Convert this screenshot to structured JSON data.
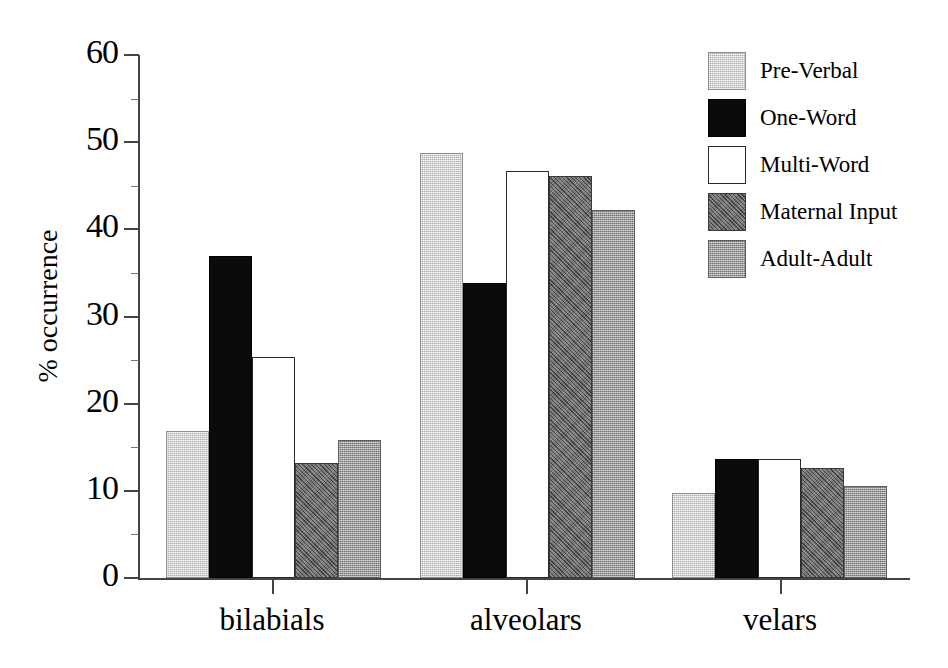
{
  "chart_data": {
    "type": "bar",
    "title": "",
    "xlabel": "",
    "ylabel": "% occurrence",
    "ylim": [
      0,
      60
    ],
    "ytick_step": 10,
    "yticks": [
      "0",
      "10",
      "20",
      "30",
      "40",
      "50",
      "60"
    ],
    "grid": false,
    "legend_position": "top-right",
    "categories": [
      "bilabials",
      "alveolars",
      "velars"
    ],
    "series": [
      {
        "name": "Pre-Verbal",
        "color": "#cdcdcd",
        "values": [
          16.9,
          48.7,
          9.7
        ]
      },
      {
        "name": "One-Word",
        "color": "#0b0b0b",
        "values": [
          36.9,
          33.8,
          13.6
        ]
      },
      {
        "name": "Multi-Word",
        "color": "#ffffff",
        "values": [
          25.3,
          46.7,
          13.6
        ]
      },
      {
        "name": "Maternal Input",
        "color": "#6f6f6f",
        "values": [
          13.2,
          46.1,
          12.6
        ]
      },
      {
        "name": "Adult-Adult",
        "color": "#9a9a9a",
        "values": [
          15.8,
          42.2,
          10.6
        ]
      }
    ]
  },
  "axis": {
    "y_title": "% occurrence",
    "y_labels": [
      "60",
      "50",
      "40",
      "30",
      "20",
      "10",
      "0"
    ]
  },
  "legend": {
    "entries": [
      {
        "label": "Pre-Verbal",
        "swatch": "legend-swatch-pre-verbal"
      },
      {
        "label": "One-Word",
        "swatch": "legend-swatch-one-word"
      },
      {
        "label": "Multi-Word",
        "swatch": "legend-swatch-multi-word"
      },
      {
        "label": "Maternal Input",
        "swatch": "legend-swatch-maternal-input"
      },
      {
        "label": "Adult-Adult",
        "swatch": "legend-swatch-adult-adult"
      }
    ]
  },
  "categories": {
    "items": [
      "bilabials",
      "alveolars",
      "velars"
    ]
  }
}
